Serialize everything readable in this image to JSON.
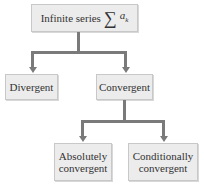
{
  "diagram": {
    "root": {
      "label": "Infinite series",
      "symbol": "∑",
      "term": "a",
      "subscript": "k"
    },
    "level1": [
      {
        "label": "Divergent"
      },
      {
        "label": "Convergent"
      }
    ],
    "level2": [
      {
        "line1": "Absolutely",
        "line2": "convergent"
      },
      {
        "line1": "Conditionally",
        "line2": "convergent"
      }
    ],
    "colors": {
      "box_fill": "#ececec",
      "connector": "#7a7a7a"
    }
  }
}
